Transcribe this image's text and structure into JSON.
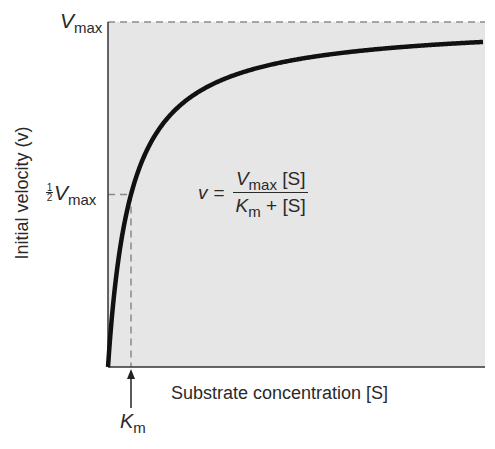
{
  "chart_data": {
    "type": "line",
    "title": "",
    "xlabel": "Substrate concentration [S]",
    "ylabel": "Initial velocity (v)",
    "series": [
      {
        "name": "Michaelis-Menten curve",
        "equation": "v = Vmax [S] / (Km + [S])",
        "x_relative_to_Km": [
          0,
          0.5,
          1,
          2,
          3,
          4,
          6,
          8,
          10,
          12,
          16.3
        ],
        "v_relative_to_Vmax": [
          0,
          0.333,
          0.5,
          0.667,
          0.75,
          0.8,
          0.857,
          0.889,
          0.909,
          0.923,
          0.942
        ]
      }
    ],
    "y_ticks": [
      "Vmax",
      "1/2 Vmax"
    ],
    "x_ticks": [
      "Km"
    ],
    "annotations": [
      "dashed horizontal line at Vmax",
      "dashed lines marking 1/2 Vmax and Km",
      "arrow pointing up to Km on x-axis"
    ],
    "grid": false,
    "legend": "none",
    "plot_background": "#e6e6e6",
    "curve_color": "#111111",
    "dash_color": "#8a8a8a"
  },
  "labels": {
    "vmax_main": "V",
    "vmax_sub": "max",
    "half_num": "1",
    "half_den": "2",
    "km_main": "K",
    "km_sub": "m",
    "ylabel": "Initial velocity (v)",
    "xlabel": "Substrate concentration [S]"
  },
  "equation": {
    "lhs": "v",
    "equals": "=",
    "num_main": "V",
    "num_sub": "max",
    "num_rest": " [S]",
    "den_main": "K",
    "den_sub": "m",
    "den_rest": " + [S]"
  }
}
